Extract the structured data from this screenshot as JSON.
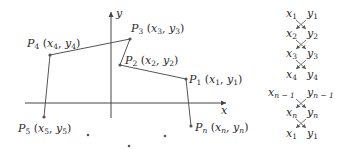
{
  "figure": {
    "axes": {
      "x_label": "x",
      "y_label": "y"
    },
    "points": [
      {
        "id": "P1",
        "name": "P",
        "index": "1",
        "coords": [
          "x",
          "1",
          "y",
          "1"
        ],
        "px": [
          186,
          79
        ]
      },
      {
        "id": "P2",
        "name": "P",
        "index": "2",
        "coords": [
          "x",
          "2",
          "y",
          "2"
        ],
        "px": [
          120,
          65
        ]
      },
      {
        "id": "P3",
        "name": "P",
        "index": "3",
        "coords": [
          "x",
          "3",
          "y",
          "3"
        ],
        "px": [
          130,
          39
        ]
      },
      {
        "id": "P4",
        "name": "P",
        "index": "4",
        "coords": [
          "x",
          "4",
          "y",
          "4"
        ],
        "px": [
          50,
          55
        ]
      },
      {
        "id": "P5",
        "name": "P",
        "index": "5",
        "coords": [
          "x",
          "5",
          "y",
          "5"
        ],
        "px": [
          44,
          117
        ]
      },
      {
        "id": "Pn",
        "name": "P",
        "index": "n",
        "coords": [
          "x",
          "n",
          "y",
          "n"
        ],
        "px": [
          191,
          126
        ]
      }
    ],
    "ellipsis_dots": [
      [
        88,
        135
      ],
      [
        129,
        146
      ],
      [
        165,
        136
      ]
    ],
    "scheme": {
      "rows": [
        {
          "x": "x",
          "xsub": "1",
          "y": "y",
          "ysub": "1"
        },
        {
          "x": "x",
          "xsub": "2",
          "y": "y",
          "ysub": "2"
        },
        {
          "x": "x",
          "xsub": "3",
          "y": "y",
          "ysub": "3"
        },
        {
          "x": "x",
          "xsub": "4",
          "y": "y",
          "ysub": "4"
        },
        {
          "x": "x",
          "xsub": "n − 1",
          "y": "y",
          "ysub": "n − 1"
        },
        {
          "x": "x",
          "xsub": "n",
          "y": "y",
          "ysub": "n"
        },
        {
          "x": "x",
          "xsub": "1",
          "y": "y",
          "ysub": "1"
        }
      ],
      "crosses_between_rows": [
        [
          0,
          1
        ],
        [
          1,
          2
        ],
        [
          2,
          3
        ],
        [
          4,
          5
        ],
        [
          5,
          6
        ]
      ]
    }
  }
}
